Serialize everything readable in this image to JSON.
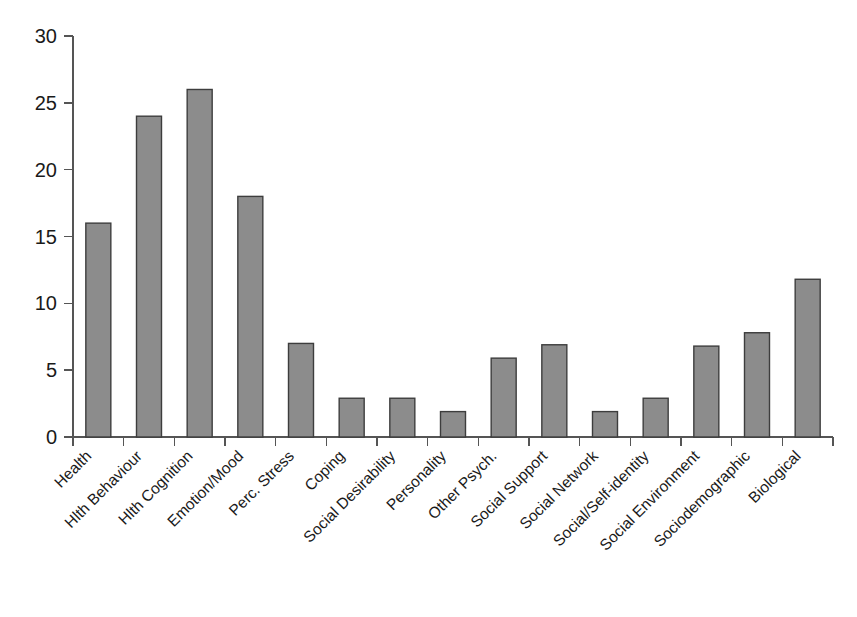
{
  "chart_data": {
    "type": "bar",
    "title": "",
    "subtitle": "",
    "xlabel": "",
    "ylabel": "",
    "ylim": [
      0,
      30
    ],
    "ytick_labels": [
      "0",
      "5",
      "10",
      "15",
      "20",
      "25",
      "30"
    ],
    "ytick_values": [
      0,
      5,
      10,
      15,
      20,
      25,
      30
    ],
    "grid": false,
    "legend": null,
    "bar_color": "#8c8c8c",
    "bar_edge_color": "#3d3d3d",
    "background_color": "#ffffff",
    "axis_color": "#555555",
    "xtick_label_rotation": 45,
    "categories": [
      "Health",
      "Hlth Behaviour",
      "Hlth Cognition",
      "Emotion/Mood",
      "Perc. Stress",
      "Coping",
      "Social Desirability",
      "Personality",
      "Other Psych.",
      "Social Support",
      "Social Network",
      "Social/Self-identity",
      "Social Environment",
      "Sociodemographic",
      "Biological"
    ],
    "values": [
      16,
      24,
      26,
      18,
      7,
      2.9,
      2.9,
      1.9,
      5.9,
      6.9,
      1.9,
      2.9,
      6.8,
      7.8,
      11.8
    ]
  }
}
